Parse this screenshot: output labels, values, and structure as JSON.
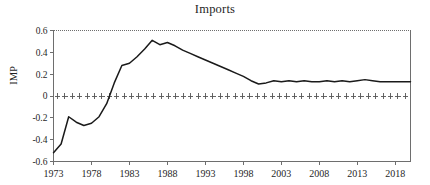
{
  "chart_data": {
    "type": "line",
    "title": "Imports",
    "xlabel": "",
    "ylabel": "IMP",
    "xlim": [
      1973,
      2020
    ],
    "ylim": [
      -0.6,
      0.6
    ],
    "grid": false,
    "legend": null,
    "y_ticks": [
      0.6,
      0.4,
      0.2,
      0,
      -0.2,
      -0.4,
      -0.6
    ],
    "y_tick_labels": [
      "0.6",
      "0.4",
      "0.2",
      "0",
      "-0.2",
      "-0.4",
      "-0.6"
    ],
    "x_ticks": [
      1973,
      1978,
      1983,
      1988,
      1993,
      1998,
      2003,
      2008,
      2013,
      2018
    ],
    "x_tick_labels": [
      "1973",
      "1978",
      "1983",
      "1988",
      "1993",
      "1998",
      "2003",
      "2008",
      "2013",
      "2018"
    ],
    "zero_line_style": "cross-markers",
    "series": [
      {
        "name": "IMP",
        "color": "#1a1a1a",
        "x": [
          1973,
          1974,
          1975,
          1976,
          1977,
          1978,
          1979,
          1980,
          1981,
          1982,
          1983,
          1984,
          1985,
          1986,
          1987,
          1988,
          1989,
          1990,
          1991,
          1992,
          1993,
          1994,
          1995,
          1996,
          1997,
          1998,
          1999,
          2000,
          2001,
          2002,
          2003,
          2004,
          2005,
          2006,
          2007,
          2008,
          2009,
          2010,
          2011,
          2012,
          2013,
          2014,
          2015,
          2016,
          2017,
          2018,
          2019,
          2020
        ],
        "values": [
          -0.52,
          -0.44,
          -0.19,
          -0.24,
          -0.27,
          -0.25,
          -0.19,
          -0.07,
          0.12,
          0.28,
          0.3,
          0.36,
          0.43,
          0.51,
          0.47,
          0.49,
          0.46,
          0.42,
          0.39,
          0.36,
          0.33,
          0.3,
          0.27,
          0.24,
          0.21,
          0.18,
          0.14,
          0.11,
          0.12,
          0.14,
          0.13,
          0.14,
          0.13,
          0.14,
          0.13,
          0.13,
          0.14,
          0.13,
          0.14,
          0.13,
          0.14,
          0.15,
          0.14,
          0.13,
          0.13,
          0.13,
          0.13,
          0.13
        ]
      }
    ]
  },
  "colors": {
    "line": "#1a1a1a",
    "axis": "#6e6e6e",
    "text": "#1f1f1f",
    "background": "#ffffff"
  }
}
